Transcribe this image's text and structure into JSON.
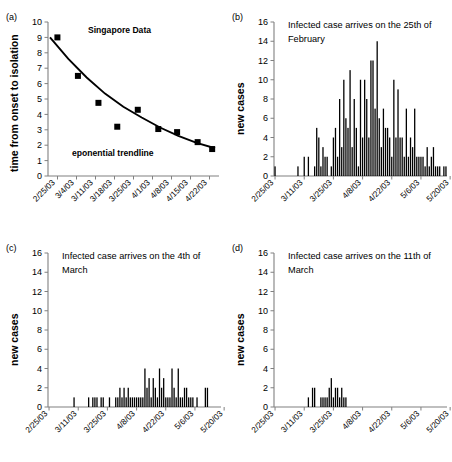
{
  "figure": {
    "panels": [
      {
        "id": "a",
        "label": "(a)",
        "ylabel": "time from onset to isolation",
        "annotations": [
          "Singapore Data",
          "eponential trendline"
        ]
      },
      {
        "id": "b",
        "label": "(b)",
        "ylabel": "new cases",
        "title_line1": "Infected case arrives on the 25th of",
        "title_line2": "February"
      },
      {
        "id": "c",
        "label": "(c)",
        "ylabel": "new cases",
        "title_line1": "Infected case arrives on the 4th of",
        "title_line2": "March"
      },
      {
        "id": "d",
        "label": "(d)",
        "ylabel": "new cases",
        "title_line1": "Infected case arrives on the 11th of",
        "title_line2": "March"
      }
    ]
  },
  "chart_data": [
    {
      "type": "scatter",
      "panel": "a",
      "title": "",
      "xlabel": "",
      "ylabel": "time from onset to isolation",
      "ylim": [
        0,
        10
      ],
      "yticks": [
        0,
        1,
        2,
        3,
        4,
        5,
        6,
        7,
        8,
        9,
        10
      ],
      "xticks": [
        "2/25/03",
        "3/4/03",
        "3/11/03",
        "3/18/03",
        "3/25/03",
        "4/1/03",
        "4/8/03",
        "4/15/03",
        "4/22/03"
      ],
      "grid": false,
      "legend": "none",
      "annotations": [
        {
          "text": "Singapore Data",
          "x": "3/6/03",
          "y": 9.0
        },
        {
          "text": "eponential trendline",
          "x": "3/18/03",
          "y": 2.0
        }
      ],
      "series": [
        {
          "name": "Singapore Data",
          "marker": "square",
          "x": [
            "3/1/03",
            "3/9/03",
            "3/16/03",
            "3/24/03",
            "3/31/03",
            "4/7/03",
            "4/14/03",
            "4/21/03",
            "4/27/03"
          ],
          "values": [
            9.0,
            6.5,
            4.75,
            3.2,
            4.3,
            3.05,
            2.85,
            2.2,
            1.75
          ]
        },
        {
          "name": "eponential trendline",
          "marker": "line",
          "x": [
            "2/25/03",
            "3/4/03",
            "3/11/03",
            "3/18/03",
            "3/25/03",
            "4/1/03",
            "4/8/03",
            "4/15/03",
            "4/22/03",
            "4/29/03"
          ],
          "values": [
            9.0,
            7.6,
            6.4,
            5.35,
            4.5,
            3.8,
            3.15,
            2.6,
            2.15,
            1.8
          ]
        }
      ]
    },
    {
      "type": "bar",
      "panel": "b",
      "title": "Infected case arrives on the 25th of February",
      "xlabel": "",
      "ylabel": "new cases",
      "ylim": [
        0,
        16
      ],
      "yticks": [
        0,
        2,
        4,
        6,
        8,
        10,
        12,
        14,
        16
      ],
      "xticks": [
        "2/25/03",
        "3/11/03",
        "3/25/03",
        "4/8/03",
        "4/22/03",
        "5/6/03",
        "5/20/03"
      ],
      "x_start": "2/25/03",
      "grid": false,
      "legend": "none",
      "values": [
        1,
        0,
        0,
        0,
        0,
        0,
        0,
        0,
        0,
        0,
        0,
        1,
        0,
        0,
        2,
        0,
        2,
        0,
        0,
        1,
        5,
        4,
        1,
        3,
        2,
        2,
        0,
        1,
        4,
        5,
        2,
        8,
        3,
        10,
        6,
        5,
        11,
        3,
        8,
        5,
        1,
        10,
        4,
        10,
        8,
        4,
        12,
        12,
        7,
        14,
        6,
        3,
        7,
        5,
        5,
        4,
        2,
        10,
        4,
        9,
        4,
        4,
        2,
        7,
        2,
        4,
        3,
        7,
        2,
        2,
        2,
        2,
        1,
        3,
        1,
        2,
        3,
        1,
        1,
        1,
        0,
        1,
        1
      ]
    },
    {
      "type": "bar",
      "panel": "c",
      "title": "Infected case arrives on the 4th of March",
      "xlabel": "",
      "ylabel": "new cases",
      "ylim": [
        0,
        16
      ],
      "yticks": [
        0,
        2,
        4,
        6,
        8,
        10,
        12,
        14,
        16
      ],
      "xticks": [
        "2/25/03",
        "3/11/03",
        "3/25/03",
        "4/8/03",
        "4/22/03",
        "5/6/03",
        "5/20/03"
      ],
      "x_start": "2/25/03",
      "grid": false,
      "legend": "none",
      "values": [
        0,
        0,
        0,
        0,
        0,
        0,
        0,
        0,
        0,
        0,
        0,
        0,
        1,
        0,
        0,
        0,
        0,
        0,
        0,
        1,
        0,
        1,
        1,
        1,
        0,
        1,
        1,
        0,
        0,
        1,
        0,
        0,
        1,
        1,
        2,
        1,
        2,
        1,
        2,
        1,
        1,
        1,
        1,
        1,
        1,
        1,
        4,
        2,
        3,
        1,
        3,
        2,
        1,
        4,
        2,
        3,
        1,
        1,
        1,
        4,
        2,
        1,
        4,
        1,
        1,
        2,
        2,
        1,
        1,
        1,
        0,
        1,
        0,
        0,
        0,
        2,
        2,
        0,
        0,
        0,
        0,
        0,
        0
      ]
    },
    {
      "type": "bar",
      "panel": "d",
      "title": "Infected case arrives on the 11th of March",
      "xlabel": "",
      "ylabel": "new cases",
      "ylim": [
        0,
        16
      ],
      "yticks": [
        0,
        2,
        4,
        6,
        8,
        10,
        12,
        14,
        16
      ],
      "xticks": [
        "2/25/03",
        "3/11/03",
        "3/25/03",
        "4/8/03",
        "4/22/03",
        "5/6/03",
        "5/20/03"
      ],
      "x_start": "2/25/03",
      "grid": false,
      "legend": "none",
      "values": [
        0,
        0,
        0,
        0,
        0,
        0,
        0,
        0,
        0,
        0,
        0,
        0,
        0,
        0,
        0,
        0,
        1,
        0,
        2,
        2,
        0,
        0,
        1,
        1,
        1,
        1,
        2,
        3,
        1,
        2,
        2,
        1,
        2,
        1,
        1,
        0,
        0,
        0,
        0,
        0,
        0,
        0,
        0,
        0,
        0,
        0,
        0,
        0,
        0,
        0,
        0,
        0,
        0,
        0,
        0,
        0,
        0,
        0,
        0,
        0,
        0,
        0,
        0,
        0,
        0,
        0,
        0,
        0,
        0,
        0,
        0,
        0,
        0,
        0,
        0,
        0,
        0,
        0,
        0,
        0,
        0,
        0,
        0
      ]
    }
  ],
  "colors": {
    "ink": "#000000",
    "axis": "#808080",
    "bar": "#000000"
  }
}
